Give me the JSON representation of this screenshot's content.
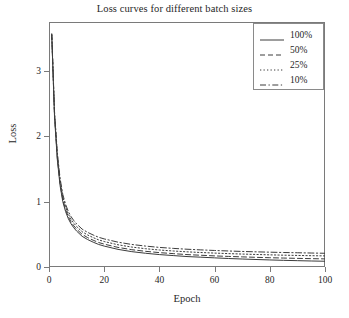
{
  "chart_data": {
    "type": "line",
    "title": "Loss curves for different batch sizes",
    "xlabel": "Epoch",
    "ylabel": "Loss",
    "xlim": [
      0,
      100
    ],
    "ylim": [
      0,
      3.75
    ],
    "xticks": [
      0,
      20,
      40,
      60,
      80,
      100
    ],
    "yticks": [
      0,
      1,
      2,
      3
    ],
    "grid": false,
    "legend_position": "top-right",
    "x": [
      1,
      2,
      3,
      4,
      5,
      6,
      7,
      8,
      9,
      10,
      12,
      14,
      16,
      18,
      20,
      25,
      30,
      35,
      40,
      45,
      50,
      55,
      60,
      65,
      70,
      75,
      80,
      85,
      90,
      95,
      100
    ],
    "series": [
      {
        "name": "100%",
        "linestyle": "solid",
        "color": "#3c3c3c",
        "values": [
          3.55,
          2.3,
          1.65,
          1.25,
          1.0,
          0.85,
          0.74,
          0.66,
          0.6,
          0.55,
          0.47,
          0.42,
          0.38,
          0.345,
          0.32,
          0.27,
          0.235,
          0.21,
          0.19,
          0.175,
          0.16,
          0.15,
          0.14,
          0.13,
          0.122,
          0.115,
          0.108,
          0.102,
          0.097,
          0.092,
          0.088
        ]
      },
      {
        "name": "50%",
        "linestyle": "dashed",
        "color": "#3c3c3c",
        "values": [
          3.55,
          2.32,
          1.68,
          1.28,
          1.03,
          0.88,
          0.77,
          0.69,
          0.63,
          0.58,
          0.5,
          0.45,
          0.41,
          0.375,
          0.35,
          0.3,
          0.265,
          0.24,
          0.22,
          0.205,
          0.19,
          0.18,
          0.17,
          0.162,
          0.155,
          0.148,
          0.142,
          0.137,
          0.132,
          0.128,
          0.124
        ]
      },
      {
        "name": "25%",
        "linestyle": "dotted",
        "color": "#3c3c3c",
        "values": [
          3.56,
          2.35,
          1.72,
          1.32,
          1.07,
          0.92,
          0.81,
          0.73,
          0.67,
          0.62,
          0.54,
          0.49,
          0.45,
          0.415,
          0.39,
          0.34,
          0.305,
          0.28,
          0.26,
          0.245,
          0.232,
          0.222,
          0.213,
          0.205,
          0.198,
          0.192,
          0.186,
          0.181,
          0.177,
          0.173,
          0.17
        ]
      },
      {
        "name": "10%",
        "linestyle": "dashdot",
        "color": "#3c3c3c",
        "values": [
          3.57,
          2.38,
          1.76,
          1.36,
          1.11,
          0.96,
          0.85,
          0.77,
          0.71,
          0.66,
          0.58,
          0.53,
          0.49,
          0.455,
          0.43,
          0.38,
          0.345,
          0.32,
          0.3,
          0.285,
          0.272,
          0.262,
          0.253,
          0.245,
          0.238,
          0.232,
          0.227,
          0.222,
          0.218,
          0.214,
          0.21
        ]
      }
    ]
  },
  "legend": {
    "entries": [
      {
        "label": "100%",
        "style": "solid"
      },
      {
        "label": "50%",
        "style": "dashed"
      },
      {
        "label": "25%",
        "style": "dotted"
      },
      {
        "label": "10%",
        "style": "dashdot"
      }
    ]
  },
  "axis_tick_labels": {
    "x": [
      "0",
      "20",
      "40",
      "60",
      "80",
      "100"
    ],
    "y": [
      "0",
      "1",
      "2",
      "3"
    ]
  }
}
